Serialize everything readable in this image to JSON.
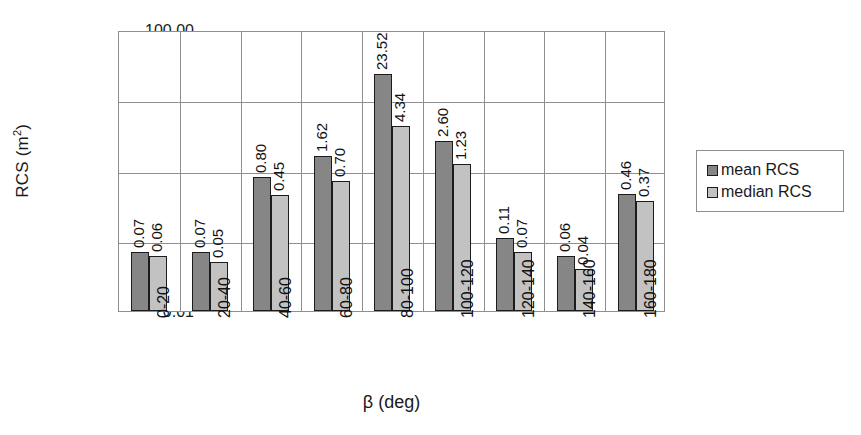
{
  "chart_data": {
    "type": "bar",
    "title": "",
    "xlabel": "β (deg)",
    "ylabel": "RCS (m²)",
    "ylabel_text": "RCS (m",
    "ylabel_sup": "2",
    "ylabel_tail": ")",
    "yscale": "log",
    "ylim": [
      0.01,
      100
    ],
    "ytick_labels": [
      "100.00",
      "10.00",
      "1.00",
      "0.10",
      "0.01"
    ],
    "ytick_values": [
      100,
      10,
      1,
      0.1,
      0.01
    ],
    "grid": true,
    "legend_position": "right",
    "categories": [
      "0-20",
      "20-40",
      "40-60",
      "60-80",
      "80-100",
      "100-120",
      "120-140",
      "140-160",
      "160-180"
    ],
    "series": [
      {
        "name": "mean RCS",
        "color": "#868686",
        "values": [
          0.07,
          0.07,
          0.8,
          1.62,
          23.52,
          2.6,
          0.11,
          0.06,
          0.46
        ],
        "labels": [
          "0.07",
          "0.07",
          "0.80",
          "1.62",
          "23.52",
          "2.60",
          "0.11",
          "0.06",
          "0.46"
        ]
      },
      {
        "name": "median RCS",
        "color": "#c2c2c2",
        "values": [
          0.06,
          0.05,
          0.45,
          0.7,
          4.34,
          1.23,
          0.07,
          0.04,
          0.37
        ],
        "labels": [
          "0.06",
          "0.05",
          "0.45",
          "0.70",
          "4.34",
          "1.23",
          "0.07",
          "0.04",
          "0.37"
        ]
      }
    ]
  },
  "legend": {
    "entries": [
      {
        "label": "mean RCS",
        "color": "#868686"
      },
      {
        "label": "median RCS",
        "color": "#c2c2c2"
      }
    ]
  },
  "colors": {
    "mean": "#868686",
    "median": "#c2c2c2",
    "grid": "#8f8f8f",
    "bar_outline": "#1c1c1c",
    "background": "#ffffff"
  }
}
